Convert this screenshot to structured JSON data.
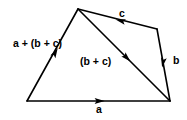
{
  "figure": {
    "background_color": "#ffffff",
    "stroke_color": "#000000",
    "labels": {
      "resultant": "a + (b + c)",
      "partial_sum": "(b + c)",
      "vector_a": "a",
      "vector_b": "b",
      "vector_c": "c"
    },
    "vertices": {
      "bottom_left": [
        27,
        101
      ],
      "apex_top": [
        78,
        9
      ],
      "top_right": [
        157,
        29
      ],
      "bottom_right": [
        170,
        101
      ]
    },
    "edges": [
      {
        "name": "resultant-edge",
        "label": "a + (b + c)",
        "from": [
          27,
          101
        ],
        "to": [
          78,
          9
        ],
        "arrow_at": [
          55,
          53
        ],
        "arrow_direction": "up-right"
      },
      {
        "name": "vector-c-edge",
        "label": "c",
        "from": [
          157,
          29
        ],
        "to": [
          78,
          9
        ],
        "arrow_at": [
          121,
          21
        ],
        "arrow_direction": "left"
      },
      {
        "name": "vector-b-edge",
        "label": "b",
        "from": [
          157,
          29
        ],
        "to": [
          170,
          101
        ],
        "arrow_at": [
          164,
          62
        ],
        "arrow_direction": "down"
      },
      {
        "name": "partial-sum-edge",
        "label": "(b + c)",
        "from": [
          78,
          9
        ],
        "to": [
          170,
          101
        ],
        "arrow_at": [
          126,
          55
        ],
        "arrow_direction": "down-right"
      },
      {
        "name": "vector-a-edge",
        "label": "a",
        "from": [
          27,
          101
        ],
        "to": [
          170,
          101
        ],
        "arrow_at": [
          99,
          101
        ],
        "arrow_direction": "right"
      }
    ]
  }
}
